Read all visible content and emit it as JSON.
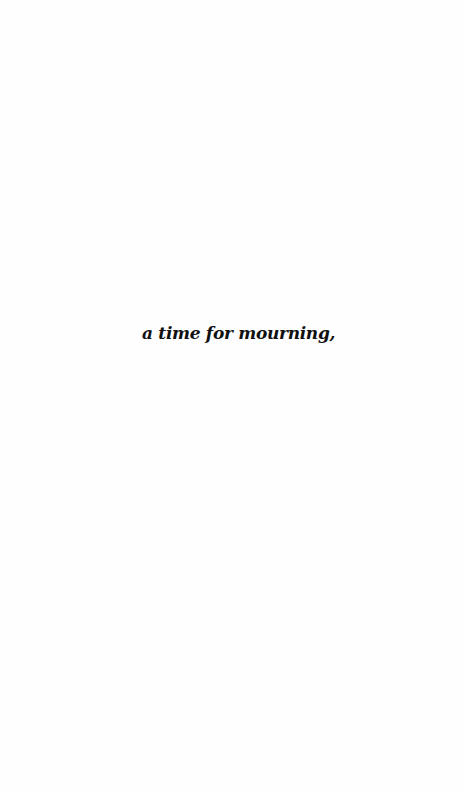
{
  "page": {
    "background": "#fefefe",
    "text_color": "#111111",
    "lines": [
      {
        "text": "a time for mourning,"
      }
    ]
  }
}
